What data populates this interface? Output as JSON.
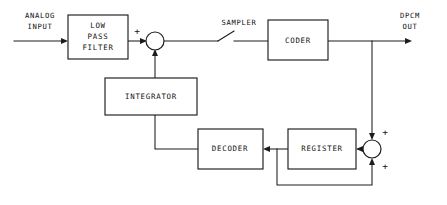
{
  "diagram": {
    "line_color": "#1c1c1c",
    "background_color": "#ffffff",
    "blocks": [
      {
        "id": "low_pass_filter",
        "label_line1": "LOW",
        "label_line2": "PASS",
        "label_line3": "FILTER"
      },
      {
        "id": "coder",
        "label": "CODER"
      },
      {
        "id": "integrator",
        "label": "INTEGRATOR"
      },
      {
        "id": "decoder",
        "label": "DECODER"
      },
      {
        "id": "register",
        "label": "REGISTER"
      }
    ],
    "io": {
      "input_line1": "ANALOG",
      "input_line2": "INPUT",
      "output_line1": "DPCM",
      "output_line2": "OUT"
    },
    "annotations": {
      "sampler": "SAMPLER",
      "sum1_plus": "+",
      "sum2_plus_top": "+",
      "sum2_plus_bottom": "+"
    }
  }
}
